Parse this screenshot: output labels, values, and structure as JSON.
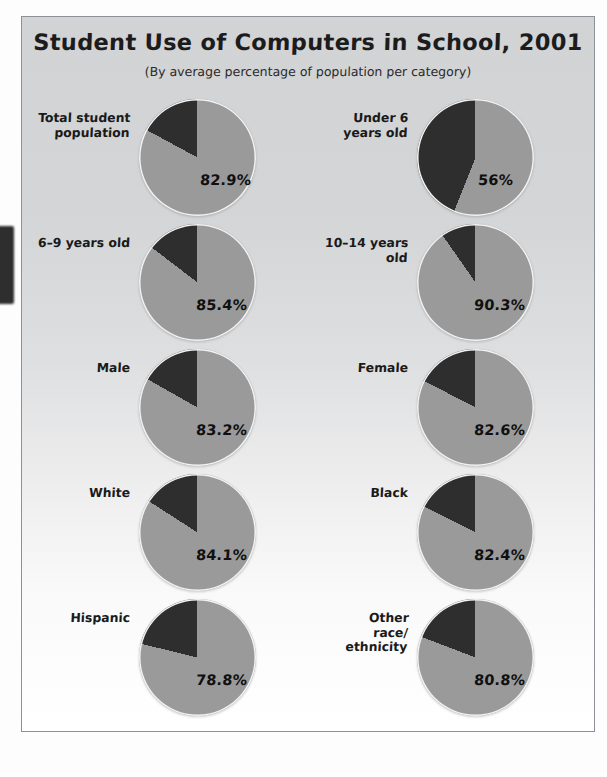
{
  "chart_data": {
    "type": "pie",
    "title": "Student Use of Computers in School, 2001",
    "subtitle": "(By average percentage of population per category)",
    "xlabel": "",
    "ylabel": "",
    "legend": [],
    "note": "Each small multiple is a two-slice pie: the light gray slice is the labeled percentage of the category that uses computers in school; the dark slice is the remainder. Slices start at 12 o'clock with the dark remainder sweeping counter-clockwise.",
    "colors": {
      "used_slice": "#9a9a9a",
      "remainder_slice": "#2e2e2e",
      "slice_outline": "#f2f2f2",
      "panel_top": "#d2d3d4",
      "panel_bottom": "#ffffff",
      "panel_border": "#8d9096",
      "text": "#1a1a1a"
    },
    "pies": [
      {
        "label": "Total student\npopulation",
        "value": 82.9,
        "value_label": "82.9%",
        "remainder": 17.1
      },
      {
        "label": "Under 6\nyears old",
        "value": 56,
        "value_label": "56%",
        "remainder": 44
      },
      {
        "label": "6–9 years old",
        "value": 85.4,
        "value_label": "85.4%",
        "remainder": 14.6
      },
      {
        "label": "10–14 years old",
        "value": 90.3,
        "value_label": "90.3%",
        "remainder": 9.7
      },
      {
        "label": "Male",
        "value": 83.2,
        "value_label": "83.2%",
        "remainder": 16.8
      },
      {
        "label": "Female",
        "value": 82.6,
        "value_label": "82.6%",
        "remainder": 17.4
      },
      {
        "label": "White",
        "value": 84.1,
        "value_label": "84.1%",
        "remainder": 15.9
      },
      {
        "label": "Black",
        "value": 82.4,
        "value_label": "82.4%",
        "remainder": 17.6
      },
      {
        "label": "Hispanic",
        "value": 78.8,
        "value_label": "78.8%",
        "remainder": 21.2
      },
      {
        "label": "Other\nrace/\nethnicity",
        "value": 80.8,
        "value_label": "80.8%",
        "remainder": 19.2
      }
    ]
  }
}
